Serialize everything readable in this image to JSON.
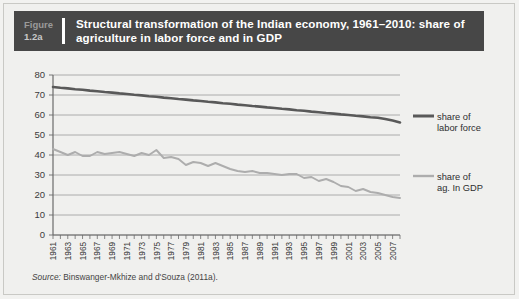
{
  "figure": {
    "label_line1": "Figure",
    "label_line2": "1.2a",
    "title": "Structural transformation of the Indian economy, 1961–2010: share of agriculture in labor force and in GDP",
    "source_prefix": "Source:",
    "source_text": "Binswanger-Mkhize and d'Souza (2011a).",
    "header_bg": "#474747",
    "page_bg": "#f0f0ee"
  },
  "legend": {
    "position": "right",
    "items": [
      {
        "label_line1": "share of",
        "label_line2": "labor force",
        "color": "#595959"
      },
      {
        "label_line1": "share of",
        "label_line2": "ag. In GDP",
        "color": "#adadad"
      }
    ]
  },
  "chart_data": {
    "type": "line",
    "title": "Structural transformation of the Indian economy, 1961–2010: share of agriculture in labor force and in GDP",
    "xlabel": "",
    "ylabel": "",
    "ylim": [
      0,
      80
    ],
    "ytick_step": 10,
    "yticks": [
      0,
      10,
      20,
      30,
      40,
      50,
      60,
      70,
      80
    ],
    "grid": true,
    "xlim": [
      1961,
      2008
    ],
    "x_tick_labels": [
      "1961",
      "1963",
      "1965",
      "1967",
      "1969",
      "1971",
      "1973",
      "1975",
      "1977",
      "1979",
      "1981",
      "1983",
      "1985",
      "1987",
      "1989",
      "1991",
      "1993",
      "1995",
      "1997",
      "1999",
      "2001",
      "2003",
      "2005",
      "2007"
    ],
    "x": [
      1961,
      1962,
      1963,
      1964,
      1965,
      1966,
      1967,
      1968,
      1969,
      1970,
      1971,
      1972,
      1973,
      1974,
      1975,
      1976,
      1977,
      1978,
      1979,
      1980,
      1981,
      1982,
      1983,
      1984,
      1985,
      1986,
      1987,
      1988,
      1989,
      1990,
      1991,
      1992,
      1993,
      1994,
      1995,
      1996,
      1997,
      1998,
      1999,
      2000,
      2001,
      2002,
      2003,
      2004,
      2005,
      2006,
      2007,
      2008
    ],
    "series": [
      {
        "name": "share of labor force",
        "color": "#595959",
        "values": [
          74.0,
          73.6,
          73.3,
          72.9,
          72.6,
          72.2,
          71.9,
          71.5,
          71.2,
          70.8,
          70.5,
          70.1,
          69.8,
          69.4,
          69.1,
          68.7,
          68.4,
          68.0,
          67.7,
          67.3,
          67.0,
          66.6,
          66.3,
          65.9,
          65.6,
          65.2,
          64.9,
          64.5,
          64.2,
          63.8,
          63.5,
          63.1,
          62.8,
          62.4,
          62.1,
          61.7,
          61.4,
          61.0,
          60.7,
          60.3,
          60.0,
          59.6,
          59.3,
          58.9,
          58.6,
          58.0,
          57.2,
          56.3
        ]
      },
      {
        "name": "share of ag. In GDP",
        "color": "#adadad",
        "values": [
          43.0,
          41.5,
          40.0,
          41.5,
          39.5,
          39.5,
          41.5,
          40.5,
          41.0,
          41.5,
          40.5,
          39.5,
          41.0,
          40.0,
          42.5,
          38.5,
          39.0,
          38.0,
          35.0,
          36.5,
          36.0,
          34.5,
          36.0,
          34.5,
          33.0,
          32.0,
          31.5,
          32.0,
          31.0,
          31.0,
          30.5,
          30.0,
          30.5,
          30.5,
          28.5,
          29.0,
          27.0,
          28.0,
          26.5,
          24.5,
          24.0,
          22.0,
          23.0,
          21.5,
          21.0,
          20.0,
          19.0,
          18.5
        ]
      }
    ]
  }
}
